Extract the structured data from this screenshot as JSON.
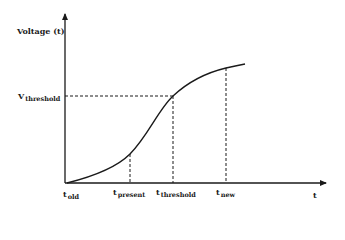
{
  "diagram": {
    "y_axis_label": "Voltage (t)",
    "x_axis_label": "t",
    "v_threshold": {
      "main": "V",
      "sub": "threshold"
    },
    "time_markers": [
      {
        "main": "t",
        "sub": "old"
      },
      {
        "main": "t",
        "sub": "present"
      },
      {
        "main": "t",
        "sub": "threshold"
      },
      {
        "main": "t",
        "sub": "new"
      }
    ],
    "colors": {
      "line": "#1a1a1a",
      "background": "#ffffff"
    }
  }
}
